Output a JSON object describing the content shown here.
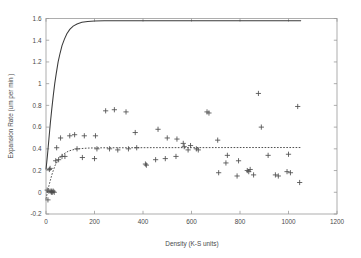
{
  "chart_data": {
    "type": "scatter",
    "title": "",
    "subtitle": "",
    "xlabel": "Density (K-S units)",
    "ylabel": "Expansion Rate (um per min )",
    "xlim": [
      0,
      1200
    ],
    "ylim": [
      -0.2,
      1.6
    ],
    "xticks": [
      0,
      200,
      400,
      600,
      800,
      1000,
      1200
    ],
    "xtick_labels": [
      "0",
      "200",
      "400",
      "600",
      "800",
      "1000",
      "1200"
    ],
    "yticks": [
      -0.2,
      0,
      0.2,
      0.4,
      0.6,
      0.8,
      1,
      1.2,
      1.4,
      1.6
    ],
    "ytick_labels": [
      "-0.2",
      "0",
      "0.2",
      "0.4",
      "0.6",
      "0.8",
      "1",
      "1.2",
      "1.4",
      "1.6"
    ],
    "grid": false,
    "legend": null,
    "legend_position": "none",
    "marker": "plus",
    "marker_color": "#4e4e4e",
    "line_color": "#3a3a3a",
    "annotations": [],
    "series": [
      {
        "name": "Expansion rate measurements",
        "type": "scatter",
        "marker": "plus",
        "points": [
          [
            5,
            0.02
          ],
          [
            8,
            -0.07
          ],
          [
            12,
            0.01
          ],
          [
            14,
            0.21
          ],
          [
            17,
            0.22
          ],
          [
            20,
            0.01
          ],
          [
            22,
            0.0
          ],
          [
            24,
            0.01
          ],
          [
            26,
            0.0
          ],
          [
            30,
            0.01
          ],
          [
            34,
            0.0
          ],
          [
            40,
            0.29
          ],
          [
            44,
            0.41
          ],
          [
            52,
            0.3
          ],
          [
            60,
            0.5
          ],
          [
            66,
            0.33
          ],
          [
            78,
            0.33
          ],
          [
            98,
            0.52
          ],
          [
            118,
            0.53
          ],
          [
            128,
            0.4
          ],
          [
            150,
            0.32
          ],
          [
            158,
            0.52
          ],
          [
            200,
            0.31
          ],
          [
            204,
            0.52
          ],
          [
            210,
            0.4
          ],
          [
            246,
            0.75
          ],
          [
            262,
            0.4
          ],
          [
            282,
            0.76
          ],
          [
            296,
            0.39
          ],
          [
            330,
            0.74
          ],
          [
            340,
            0.4
          ],
          [
            368,
            0.55
          ],
          [
            374,
            0.41
          ],
          [
            410,
            0.26
          ],
          [
            414,
            0.25
          ],
          [
            452,
            0.3
          ],
          [
            462,
            0.58
          ],
          [
            492,
            0.31
          ],
          [
            500,
            0.5
          ],
          [
            536,
            0.33
          ],
          [
            540,
            0.49
          ],
          [
            566,
            0.45
          ],
          [
            570,
            0.42
          ],
          [
            586,
            0.39
          ],
          [
            596,
            0.43
          ],
          [
            620,
            0.4
          ],
          [
            628,
            0.39
          ],
          [
            664,
            0.74
          ],
          [
            672,
            0.73
          ],
          [
            708,
            0.48
          ],
          [
            712,
            0.18
          ],
          [
            742,
            0.27
          ],
          [
            748,
            0.34
          ],
          [
            788,
            0.15
          ],
          [
            794,
            0.29
          ],
          [
            830,
            0.2
          ],
          [
            836,
            0.19
          ],
          [
            842,
            0.21
          ],
          [
            856,
            0.16
          ],
          [
            876,
            0.91
          ],
          [
            888,
            0.6
          ],
          [
            916,
            0.34
          ],
          [
            946,
            0.16
          ],
          [
            958,
            0.15
          ],
          [
            994,
            0.19
          ],
          [
            1000,
            0.35
          ],
          [
            1008,
            0.18
          ],
          [
            1038,
            0.79
          ],
          [
            1046,
            0.09
          ]
        ]
      },
      {
        "name": "Upper saturating model fit",
        "type": "line",
        "style": "solid",
        "plateau": 1.58,
        "points": [
          [
            0,
            0.21
          ],
          [
            6,
            0.34
          ],
          [
            12,
            0.49
          ],
          [
            18,
            0.64
          ],
          [
            24,
            0.77
          ],
          [
            30,
            0.89
          ],
          [
            36,
            1.0
          ],
          [
            42,
            1.09
          ],
          [
            50,
            1.2
          ],
          [
            58,
            1.28
          ],
          [
            66,
            1.35
          ],
          [
            76,
            1.41
          ],
          [
            86,
            1.46
          ],
          [
            98,
            1.5
          ],
          [
            112,
            1.53
          ],
          [
            128,
            1.55
          ],
          [
            148,
            1.565
          ],
          [
            172,
            1.573
          ],
          [
            200,
            1.577
          ],
          [
            240,
            1.579
          ],
          [
            300,
            1.58
          ],
          [
            400,
            1.58
          ],
          [
            600,
            1.58
          ],
          [
            800,
            1.58
          ],
          [
            1000,
            1.58
          ],
          [
            1052,
            1.58
          ]
        ]
      },
      {
        "name": "Lower saturating model fit",
        "type": "line",
        "style": "dashed",
        "plateau": 0.41,
        "points": [
          [
            0,
            -0.06
          ],
          [
            6,
            0.0
          ],
          [
            12,
            0.06
          ],
          [
            18,
            0.11
          ],
          [
            24,
            0.16
          ],
          [
            30,
            0.2
          ],
          [
            38,
            0.25
          ],
          [
            46,
            0.28
          ],
          [
            56,
            0.315
          ],
          [
            66,
            0.34
          ],
          [
            78,
            0.36
          ],
          [
            92,
            0.378
          ],
          [
            108,
            0.39
          ],
          [
            126,
            0.398
          ],
          [
            148,
            0.403
          ],
          [
            174,
            0.407
          ],
          [
            206,
            0.409
          ],
          [
            250,
            0.41
          ],
          [
            320,
            0.41
          ],
          [
            450,
            0.411
          ],
          [
            600,
            0.411
          ],
          [
            800,
            0.412
          ],
          [
            1000,
            0.412
          ],
          [
            1052,
            0.412
          ]
        ]
      }
    ]
  },
  "axes": {
    "x_axis_name": "density-axis",
    "y_axis_name": "expansion-rate-axis"
  }
}
